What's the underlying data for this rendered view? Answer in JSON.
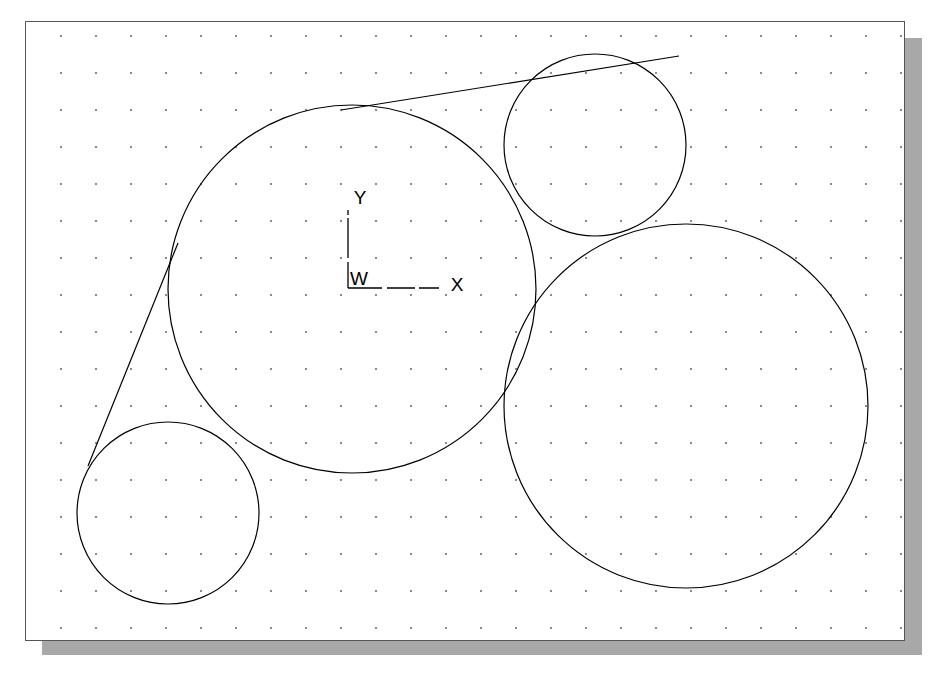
{
  "page": {
    "width": 932,
    "height": 681,
    "background_color": "#ffffff",
    "clipped_caption_above": "· ·          ·                    ·          ·"
  },
  "frame": {
    "x": 25,
    "y": 21,
    "width": 880,
    "height": 620,
    "border_color": "#555555",
    "fill_color": "#ffffff",
    "shadow_color": "#a8a8a8",
    "shadow_offset_x": 17,
    "shadow_offset_y": 17
  },
  "grid": {
    "type": "dot-grid",
    "spacing_x": 35,
    "spacing_y": 37,
    "origin_x": 35,
    "origin_y": 14,
    "dot_color": "#4a4a4a",
    "dot_size": 1.6
  },
  "ucs_icon": {
    "name": "world-coordinate-system-icon",
    "origin_x": 348,
    "origin_y": 288,
    "arm_length_x": 92,
    "arm_length_y": 78,
    "y_label": "Y",
    "x_label": "X",
    "w_label": "W",
    "stroke_color": "#000000"
  },
  "chart_data": {
    "type": "scatter",
    "title": "",
    "xlabel": "X",
    "ylabel": "Y",
    "grid": true,
    "legend": "none",
    "entities": {
      "circles": [
        {
          "id": "circle-large-center",
          "label": "Large center circle",
          "cx": 352,
          "cy": 289,
          "r": 184,
          "stroke": "#000000"
        },
        {
          "id": "circle-top-right",
          "label": "Small upper-right circle",
          "cx": 595,
          "cy": 145,
          "r": 91,
          "stroke": "#000000"
        },
        {
          "id": "circle-bottom-right",
          "label": "Large lower-right circle",
          "cx": 686,
          "cy": 406,
          "r": 182,
          "stroke": "#000000"
        },
        {
          "id": "circle-bottom-left",
          "label": "Small lower-left circle",
          "cx": 168,
          "cy": 513,
          "r": 91,
          "stroke": "#000000"
        }
      ],
      "lines": [
        {
          "id": "tangent-line-upper",
          "label": "Tangent line from large center circle to upper-right circle",
          "x1": 341,
          "y1": 110,
          "x2": 679,
          "y2": 56,
          "stroke": "#000000"
        },
        {
          "id": "tangent-line-lower-left",
          "label": "Tangent line from large center circle to lower-left circle",
          "x1": 178,
          "y1": 243,
          "x2": 88,
          "y2": 466,
          "stroke": "#000000"
        }
      ]
    }
  }
}
